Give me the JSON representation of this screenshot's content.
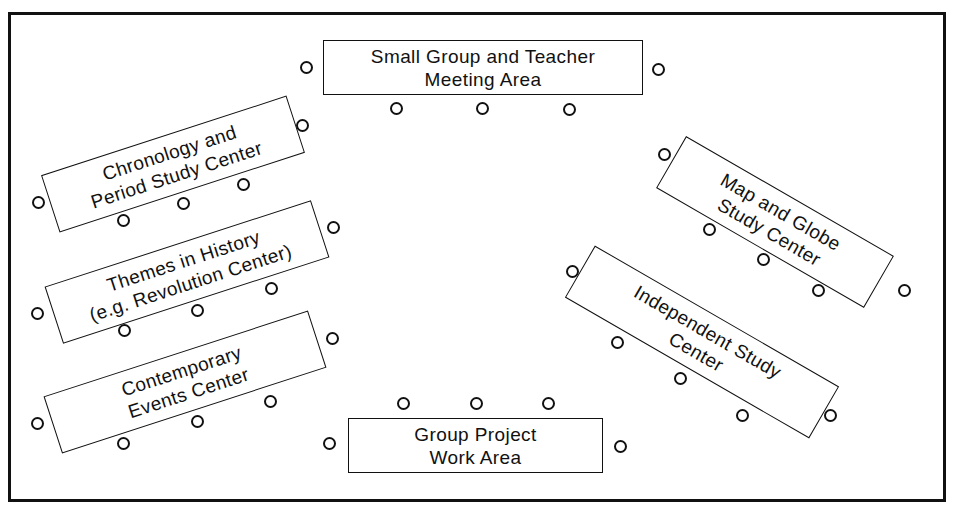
{
  "diagram": {
    "stations": [
      {
        "id": "small-group",
        "line1": "Small Group and Teacher",
        "line2": "Meeting Area"
      },
      {
        "id": "chronology",
        "line1": "Chronology and",
        "line2": "Period Study Center"
      },
      {
        "id": "themes",
        "line1": "Themes in History",
        "line2": "(e.g. Revolution Center)"
      },
      {
        "id": "contemporary",
        "line1": "Contemporary",
        "line2": "Events Center"
      },
      {
        "id": "group-project",
        "line1": "Group Project",
        "line2": "Work Area"
      },
      {
        "id": "map-globe",
        "line1": "Map and Globe",
        "line2": "Study Center"
      },
      {
        "id": "independent",
        "line1": "Independent Study",
        "line2": "Center"
      }
    ],
    "chairs": [
      {
        "station": "small-group",
        "x": 306,
        "y": 67
      },
      {
        "station": "small-group",
        "x": 658,
        "y": 69
      },
      {
        "station": "small-group",
        "x": 396,
        "y": 108
      },
      {
        "station": "small-group",
        "x": 482,
        "y": 108
      },
      {
        "station": "small-group",
        "x": 569,
        "y": 109
      },
      {
        "station": "chronology",
        "x": 302,
        "y": 125
      },
      {
        "station": "chronology",
        "x": 38,
        "y": 202
      },
      {
        "station": "chronology",
        "x": 123,
        "y": 220
      },
      {
        "station": "chronology",
        "x": 183,
        "y": 203
      },
      {
        "station": "chronology",
        "x": 243,
        "y": 184
      },
      {
        "station": "themes",
        "x": 333,
        "y": 227
      },
      {
        "station": "themes",
        "x": 37,
        "y": 313
      },
      {
        "station": "themes",
        "x": 124,
        "y": 330
      },
      {
        "station": "themes",
        "x": 197,
        "y": 310
      },
      {
        "station": "themes",
        "x": 271,
        "y": 288
      },
      {
        "station": "contemporary",
        "x": 332,
        "y": 338
      },
      {
        "station": "contemporary",
        "x": 37,
        "y": 423
      },
      {
        "station": "contemporary",
        "x": 123,
        "y": 443
      },
      {
        "station": "contemporary",
        "x": 197,
        "y": 421
      },
      {
        "station": "contemporary",
        "x": 270,
        "y": 401
      },
      {
        "station": "group-project",
        "x": 403,
        "y": 403
      },
      {
        "station": "group-project",
        "x": 476,
        "y": 403
      },
      {
        "station": "group-project",
        "x": 548,
        "y": 403
      },
      {
        "station": "group-project",
        "x": 329,
        "y": 443
      },
      {
        "station": "group-project",
        "x": 620,
        "y": 446
      },
      {
        "station": "map-globe",
        "x": 664,
        "y": 154
      },
      {
        "station": "map-globe",
        "x": 709,
        "y": 229
      },
      {
        "station": "map-globe",
        "x": 763,
        "y": 259
      },
      {
        "station": "map-globe",
        "x": 818,
        "y": 290
      },
      {
        "station": "map-globe",
        "x": 904,
        "y": 290
      },
      {
        "station": "independent",
        "x": 572,
        "y": 271
      },
      {
        "station": "independent",
        "x": 617,
        "y": 342
      },
      {
        "station": "independent",
        "x": 680,
        "y": 378
      },
      {
        "station": "independent",
        "x": 742,
        "y": 415
      },
      {
        "station": "independent",
        "x": 830,
        "y": 415
      }
    ]
  }
}
